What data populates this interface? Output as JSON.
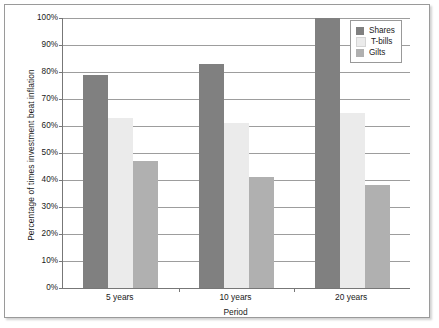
{
  "chart_data": {
    "type": "bar",
    "title": "",
    "categories": [
      "5 years",
      "10 years",
      "20 years"
    ],
    "series": [
      {
        "name": "Shares",
        "values": [
          79,
          83,
          100
        ],
        "color": "#808080"
      },
      {
        "name": "T-bills",
        "values": [
          63,
          61,
          65
        ],
        "color": "#ebebeb"
      },
      {
        "name": "Gilts",
        "values": [
          47,
          41,
          38
        ],
        "color": "#b0b0b0"
      }
    ],
    "xlabel": "Period",
    "ylabel": "Percentage of times investment beat inflation",
    "ylim": [
      0,
      100
    ],
    "ytick_labels": [
      "100%",
      "90%",
      "80%",
      "70%",
      "60%",
      "50%",
      "40%",
      "30%",
      "20%",
      "10%",
      "0%"
    ],
    "ytick_values": [
      100,
      90,
      80,
      70,
      60,
      50,
      40,
      30,
      20,
      10,
      0
    ],
    "grid": "horizontal",
    "legend_position": "top-right-inside",
    "value_suffix": "%"
  },
  "axes": {
    "y_title": "Percentage of times investment beat inflation",
    "x_title": "Period"
  },
  "legend": {
    "entries": [
      {
        "label": "Shares"
      },
      {
        "label": "T-bills"
      },
      {
        "label": "Gilts"
      }
    ]
  },
  "colors": {
    "shares": "#808080",
    "tbills": "#ebebeb",
    "gilts": "#b0b0b0",
    "gridline": "#9d9d9d",
    "axis": "#777777",
    "frame": "#9a9a9a",
    "text": "#1a1a1a",
    "background": "#ffffff"
  }
}
